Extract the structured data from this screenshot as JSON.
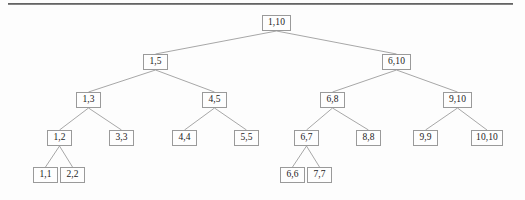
{
  "figure": {
    "type": "segment-tree-diagram",
    "title": "",
    "background_color": "#fdfdfd",
    "node_border_color": "#9a9a9a",
    "node_text_color": "#1b1b1b",
    "edge_color": "#9d9d9d",
    "rule_color": "#4a4a4a"
  },
  "nodes": [
    {
      "id": "n1_10",
      "label": "1,10",
      "x": 262,
      "y": 15,
      "w": 29,
      "h": 16,
      "level": 0
    },
    {
      "id": "n1_5",
      "label": "1,5",
      "x": 143,
      "y": 54,
      "w": 25,
      "h": 16,
      "level": 1
    },
    {
      "id": "n6_10",
      "label": "6,10",
      "x": 382,
      "y": 54,
      "w": 29,
      "h": 16,
      "level": 1
    },
    {
      "id": "n1_3",
      "label": "1,3",
      "x": 76,
      "y": 92,
      "w": 25,
      "h": 16,
      "level": 2
    },
    {
      "id": "n4_5",
      "label": "4,5",
      "x": 202,
      "y": 92,
      "w": 25,
      "h": 16,
      "level": 2
    },
    {
      "id": "n6_8",
      "label": "6,8",
      "x": 320,
      "y": 92,
      "w": 25,
      "h": 16,
      "level": 2
    },
    {
      "id": "n9_10",
      "label": "9,10",
      "x": 443,
      "y": 92,
      "w": 29,
      "h": 16,
      "level": 2
    },
    {
      "id": "n1_2",
      "label": "1,2",
      "x": 47,
      "y": 130,
      "w": 25,
      "h": 16,
      "level": 3
    },
    {
      "id": "n3_3",
      "label": "3,3",
      "x": 109,
      "y": 130,
      "w": 25,
      "h": 16,
      "level": 3
    },
    {
      "id": "n4_4",
      "label": "4,4",
      "x": 172,
      "y": 130,
      "w": 25,
      "h": 16,
      "level": 3
    },
    {
      "id": "n5_5",
      "label": "5,5",
      "x": 234,
      "y": 130,
      "w": 25,
      "h": 16,
      "level": 3
    },
    {
      "id": "n6_7",
      "label": "6,7",
      "x": 294,
      "y": 130,
      "w": 25,
      "h": 16,
      "level": 3
    },
    {
      "id": "n8_8",
      "label": "8,8",
      "x": 356,
      "y": 130,
      "w": 25,
      "h": 16,
      "level": 3
    },
    {
      "id": "n9_9",
      "label": "9,9",
      "x": 413,
      "y": 130,
      "w": 25,
      "h": 16,
      "level": 3
    },
    {
      "id": "n10_10",
      "label": "10,10",
      "x": 471,
      "y": 130,
      "w": 32,
      "h": 16,
      "level": 3
    },
    {
      "id": "n1_1",
      "label": "1,1",
      "x": 33,
      "y": 167,
      "w": 25,
      "h": 16,
      "level": 4
    },
    {
      "id": "n2_2",
      "label": "2,2",
      "x": 60,
      "y": 167,
      "w": 25,
      "h": 16,
      "level": 4
    },
    {
      "id": "n6_6",
      "label": "6,6",
      "x": 280,
      "y": 167,
      "w": 25,
      "h": 16,
      "level": 4
    },
    {
      "id": "n7_7",
      "label": "7,7",
      "x": 307,
      "y": 167,
      "w": 25,
      "h": 16,
      "level": 4
    }
  ],
  "edges": [
    {
      "from": "n1_10",
      "to": "n1_5"
    },
    {
      "from": "n1_10",
      "to": "n6_10"
    },
    {
      "from": "n1_5",
      "to": "n1_3"
    },
    {
      "from": "n1_5",
      "to": "n4_5"
    },
    {
      "from": "n6_10",
      "to": "n6_8"
    },
    {
      "from": "n6_10",
      "to": "n9_10"
    },
    {
      "from": "n1_3",
      "to": "n1_2"
    },
    {
      "from": "n1_3",
      "to": "n3_3"
    },
    {
      "from": "n4_5",
      "to": "n4_4"
    },
    {
      "from": "n4_5",
      "to": "n5_5"
    },
    {
      "from": "n6_8",
      "to": "n6_7"
    },
    {
      "from": "n6_8",
      "to": "n8_8"
    },
    {
      "from": "n9_10",
      "to": "n9_9"
    },
    {
      "from": "n9_10",
      "to": "n10_10"
    },
    {
      "from": "n1_2",
      "to": "n1_1"
    },
    {
      "from": "n1_2",
      "to": "n2_2"
    },
    {
      "from": "n6_7",
      "to": "n6_6"
    },
    {
      "from": "n6_7",
      "to": "n7_7"
    }
  ],
  "scan_rule": {
    "x": 8,
    "y": 3,
    "w": 505,
    "h": 2
  }
}
